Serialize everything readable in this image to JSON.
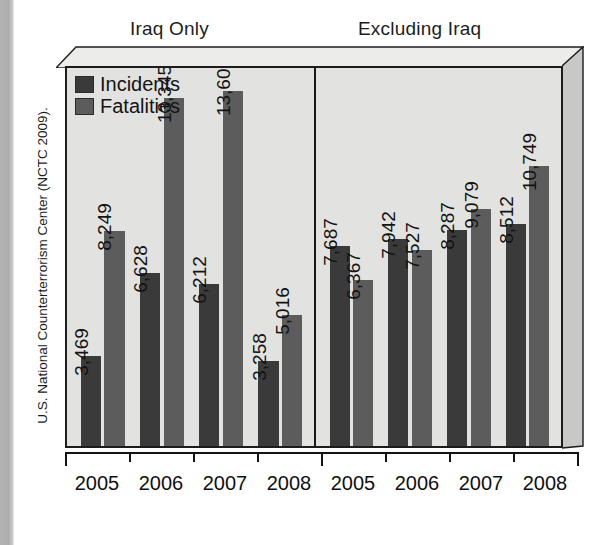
{
  "source_caption": "U.S. National Counterterrorism Center (NCTC 2009).",
  "panels": {
    "left_title": "Iraq Only",
    "right_title": "Excluding Iraq"
  },
  "legend": {
    "items": [
      {
        "label": "Incidents",
        "color": "#3a3a3a",
        "swatch_name": "legend-swatch-incidents"
      },
      {
        "label": "Fatalities",
        "color": "#5c5c5c",
        "swatch_name": "legend-swatch-fatalities"
      }
    ]
  },
  "chart_data": {
    "type": "bar",
    "title": "",
    "xlabel": "",
    "ylabel": "",
    "grid": false,
    "legend_position": "top-left",
    "ylim": [
      0,
      14500
    ],
    "panels": [
      {
        "name": "Iraq Only",
        "categories": [
          "2005",
          "2006",
          "2007",
          "2008"
        ],
        "series": [
          {
            "name": "Incidents",
            "values": [
              3469,
              6628,
              6212,
              3258
            ]
          },
          {
            "name": "Fatalities",
            "values": [
              8249,
              13345,
              13606,
              5016
            ]
          }
        ]
      },
      {
        "name": "Excluding Iraq",
        "categories": [
          "2005",
          "2006",
          "2007",
          "2008"
        ],
        "series": [
          {
            "name": "Incidents",
            "values": [
              7687,
              7942,
              8287,
              8512
            ]
          },
          {
            "name": "Fatalities",
            "values": [
              6367,
              7527,
              9079,
              10749
            ]
          }
        ]
      }
    ],
    "value_labels": {
      "left": [
        "3,469",
        "8,249",
        "6,628",
        "13,345",
        "6,212",
        "13,606",
        "3,258",
        "5,016"
      ],
      "right": [
        "7,687",
        "6,367",
        "7,942",
        "7,527",
        "8,287",
        "9,079",
        "8,512",
        "10,749"
      ]
    }
  },
  "axis": {
    "left_ticks": [
      "2005",
      "2006",
      "2007",
      "2008"
    ],
    "right_ticks": [
      "2005",
      "2006",
      "2007",
      "2008"
    ]
  },
  "colors": {
    "incidents": "#3a3a3a",
    "fatalities": "#5c5c5c",
    "plot_background": "#e2e2e0",
    "frame": "#1c1c1c"
  }
}
